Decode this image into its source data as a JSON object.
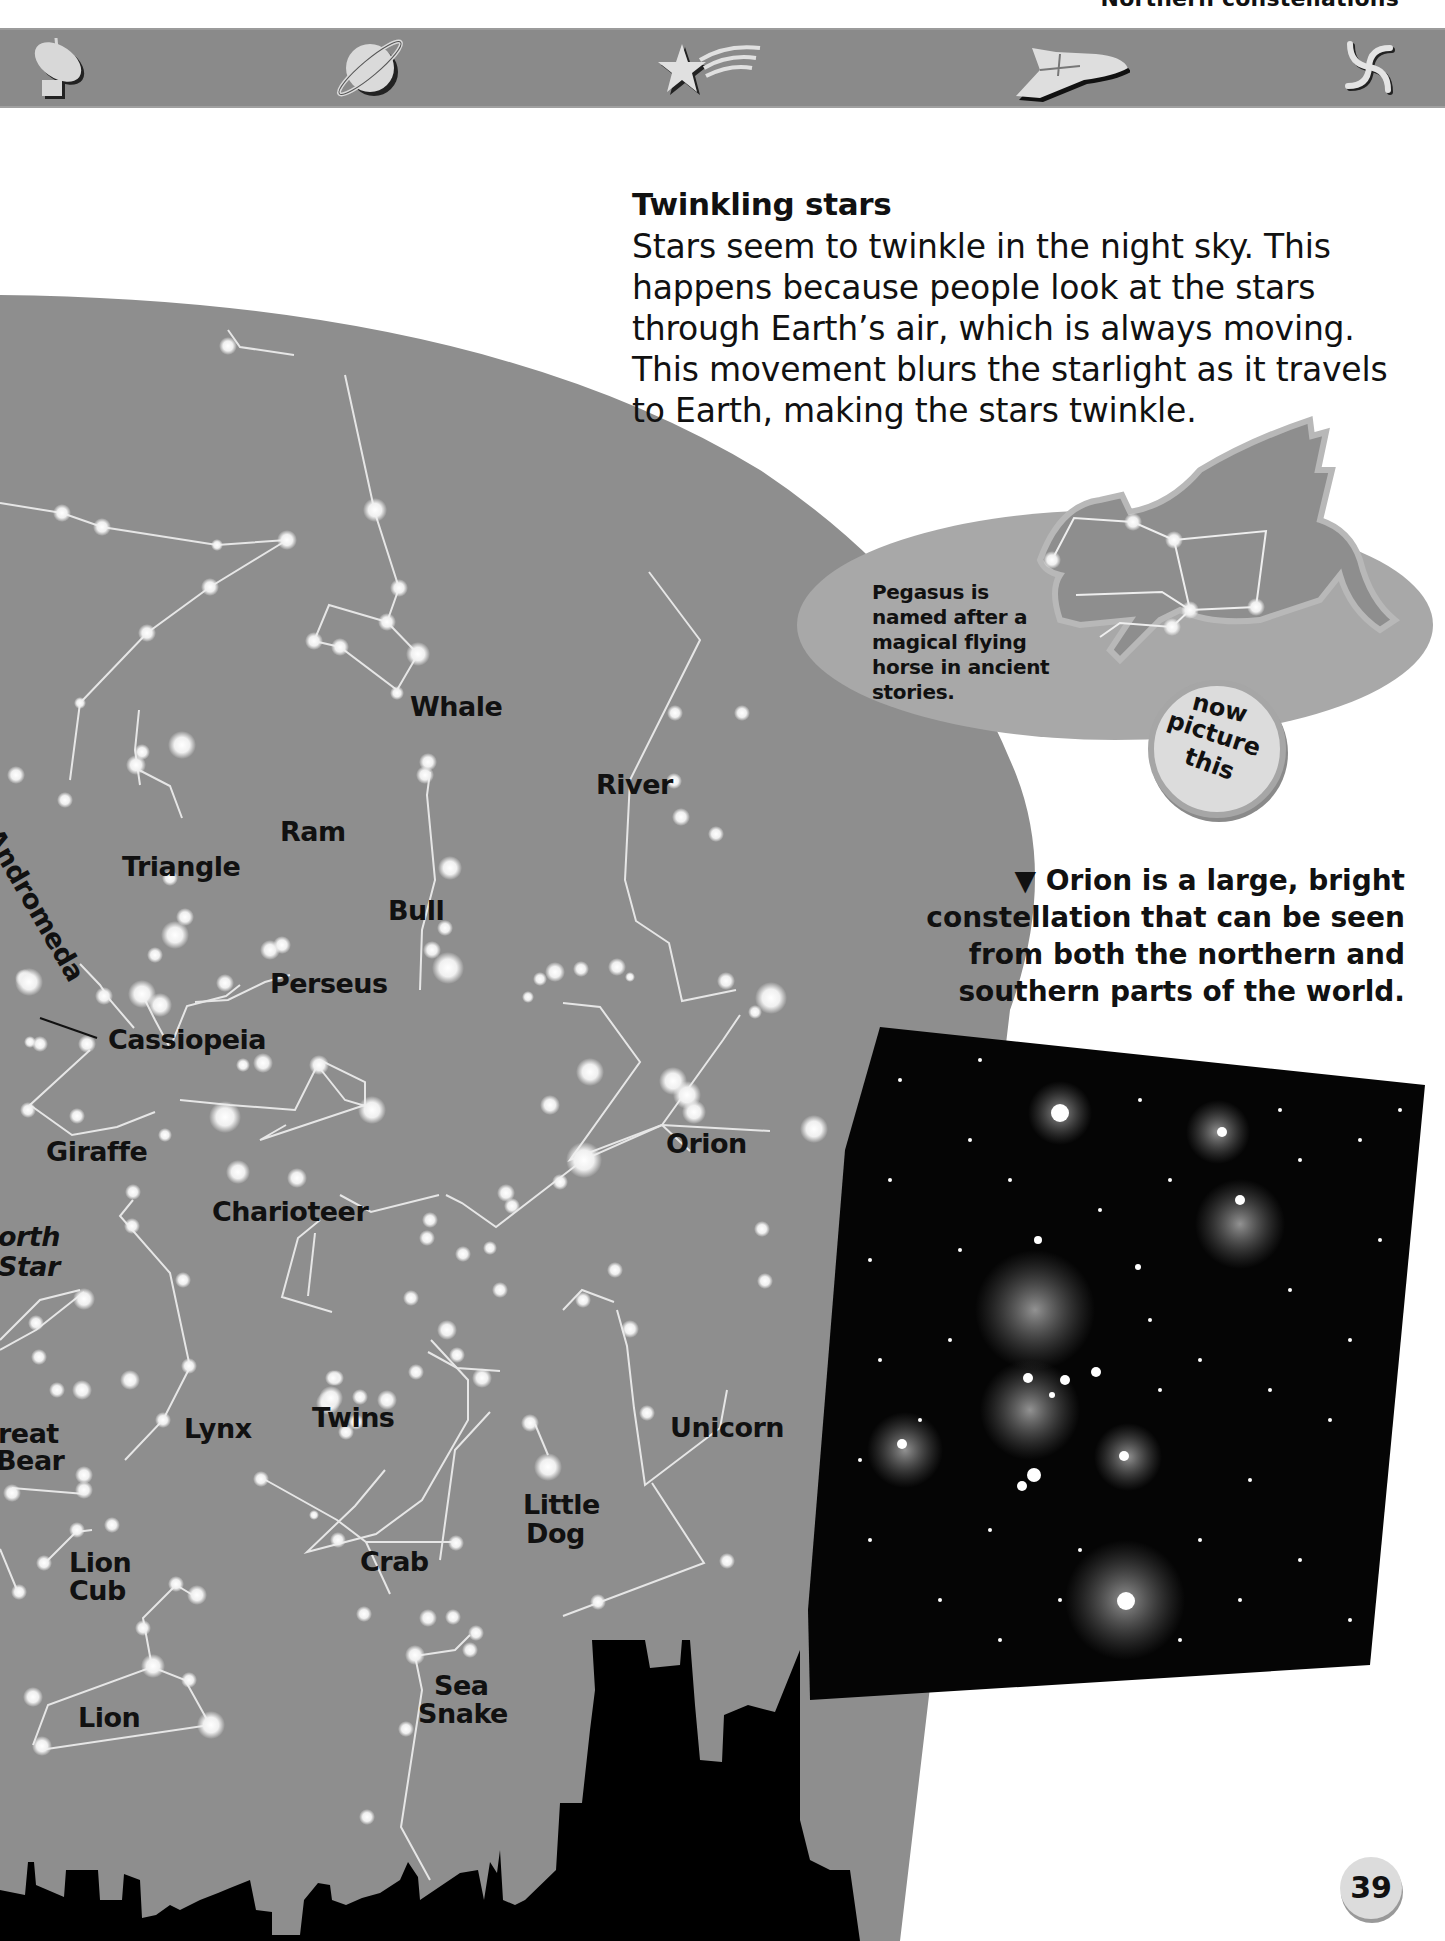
{
  "header": {
    "section_title": "Northern constellations",
    "icons": [
      "satellite-dish-icon",
      "ringed-planet-icon",
      "shooting-star-icon",
      "space-shuttle-icon",
      "spiral-galaxy-icon"
    ]
  },
  "article": {
    "title": "Twinkling stars",
    "body": "Stars seem to twinkle in the night sky. This happens because people look at the stars through Earth’s air, which is always moving. This movement blurs the starlight as it travels to Earth, making the stars twinkle."
  },
  "pegasus_box": {
    "text": "Pegasus is named after a magical flying horse in ancient stories.",
    "badge": [
      "now",
      "picture",
      "this"
    ]
  },
  "orion_caption": {
    "marker": "▼",
    "text": "Orion is a large, bright constellation that can be seen from both the northern and southern parts of the world."
  },
  "sky_map": {
    "labels": {
      "whale": "Whale",
      "river": "River",
      "ram": "Ram",
      "andromeda": "Andromeda",
      "triangle": "Triangle",
      "bull": "Bull",
      "perseus": "Perseus",
      "cassiopeia": "Cassiopeia",
      "giraffe": "Giraffe",
      "orion": "Orion",
      "charioteer": "Charioteer",
      "north_star_1": "orth",
      "north_star_2": "Star",
      "great_bear_1": "reat",
      "great_bear_2": "Bear",
      "lynx": "Lynx",
      "twins": "Twins",
      "unicorn": "Unicorn",
      "little_dog_1": "Little",
      "little_dog_2": "Dog",
      "lion_cub_1": "Lion",
      "lion_cub_2": "Cub",
      "crab": "Crab",
      "sea_snake_1": "Sea",
      "sea_snake_2": "Snake",
      "lion": "Lion"
    }
  },
  "page_number": "39",
  "colors": {
    "sky": "#8e8e8e",
    "icon_bar": "#8a8a8a",
    "star": "#f4f4f4",
    "silhouette": "#000000",
    "ellipse": "#a8a8a8"
  }
}
